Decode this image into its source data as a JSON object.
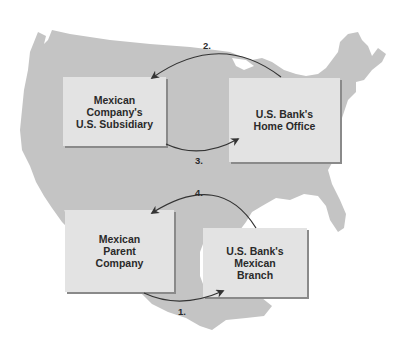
{
  "diagram": {
    "title": "",
    "colors": {
      "background": "#ffffff",
      "map": "#c4c4c4",
      "box": "#e3e3e3",
      "box_shadow": "#8a8a8a",
      "text": "#2a2a2a",
      "arrow": "#333333"
    },
    "boxes": [
      {
        "id": "subsidiary",
        "lines": [
          "Mexican Company's",
          "U.S. Subsidiary"
        ]
      },
      {
        "id": "home_office",
        "lines": [
          "U.S. Bank's",
          "Home Office"
        ]
      },
      {
        "id": "parent",
        "lines": [
          "Mexican",
          "Parent",
          "Company"
        ]
      },
      {
        "id": "branch",
        "lines": [
          "U.S. Bank's",
          "Mexican",
          "Branch"
        ]
      }
    ],
    "steps": [
      {
        "label": "1.",
        "from": "parent",
        "to": "branch"
      },
      {
        "label": "2.",
        "from": "home_office",
        "to": "subsidiary"
      },
      {
        "label": "3.",
        "from": "subsidiary",
        "to": "home_office"
      },
      {
        "label": "4.",
        "from": "branch",
        "to": "parent"
      }
    ],
    "background_map": "United States and Mexico silhouette"
  }
}
